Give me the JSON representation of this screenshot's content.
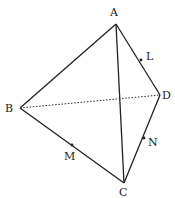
{
  "diagram": {
    "type": "tetrahedron",
    "vertices": [
      {
        "id": "A",
        "label": "A",
        "x": 116,
        "y": 24,
        "lx": 110,
        "ly": 16
      },
      {
        "id": "B",
        "label": "B",
        "x": 20,
        "y": 108,
        "lx": 5,
        "ly": 112
      },
      {
        "id": "C",
        "label": "C",
        "x": 124,
        "y": 183,
        "lx": 119,
        "ly": 196
      },
      {
        "id": "D",
        "label": "D",
        "x": 160,
        "y": 95,
        "lx": 162,
        "ly": 99
      }
    ],
    "edges": [
      {
        "from": "A",
        "to": "B",
        "style": "solid"
      },
      {
        "from": "A",
        "to": "C",
        "style": "solid"
      },
      {
        "from": "A",
        "to": "D",
        "style": "solid"
      },
      {
        "from": "B",
        "to": "C",
        "style": "solid"
      },
      {
        "from": "C",
        "to": "D",
        "style": "solid"
      },
      {
        "from": "B",
        "to": "D",
        "style": "dotted"
      }
    ],
    "points": [
      {
        "id": "L",
        "label": "L",
        "on_edge": "AD",
        "x": 141,
        "y": 60,
        "lx": 146,
        "ly": 60
      },
      {
        "id": "M",
        "label": "M",
        "on_edge": "BC",
        "x": 72,
        "y": 145,
        "lx": 64,
        "ly": 160
      },
      {
        "id": "N",
        "label": "N",
        "on_edge": "CD",
        "x": 144,
        "y": 138,
        "lx": 148,
        "ly": 146
      }
    ]
  }
}
